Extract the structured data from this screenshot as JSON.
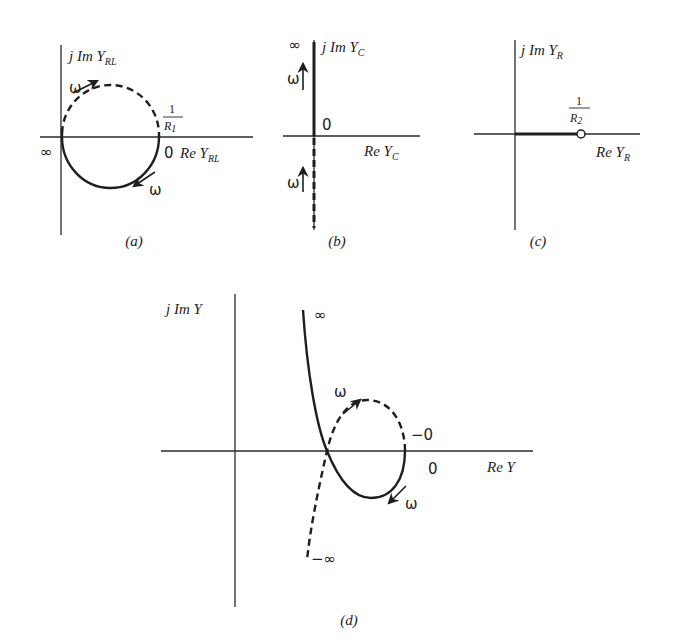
{
  "figure": {
    "panel_a": {
      "caption": "(a)",
      "y_axis_label": {
        "prefix": "j Im Y",
        "subscript": "RL"
      },
      "x_axis_label": {
        "prefix": "Re Y",
        "subscript": "RL"
      },
      "origin_label": "∞",
      "zero_label": "0",
      "intercept_label": {
        "numerator": "1",
        "denominator": "R",
        "subscript": "1"
      },
      "omega_upper": "ω",
      "omega_lower": "ω"
    },
    "panel_b": {
      "caption": "(b)",
      "y_axis_label": {
        "prefix": "j Im Y",
        "subscript": "C"
      },
      "x_axis_label": {
        "prefix": "Re Y",
        "subscript": "C"
      },
      "top_label": "∞",
      "zero_label": "0",
      "omega_upper": "ω",
      "omega_lower": "ω"
    },
    "panel_c": {
      "caption": "(c)",
      "y_axis_label": {
        "prefix": "j Im Y",
        "subscript": "R"
      },
      "x_axis_label": {
        "prefix": "Re Y",
        "subscript": "R"
      },
      "point_label": {
        "numerator": "1",
        "denominator": "R",
        "subscript": "2"
      }
    },
    "panel_d": {
      "caption": "(d)",
      "y_axis_label": "j Im Y",
      "x_axis_label": "Re Y",
      "top_label": "∞",
      "bottom_label": "−∞",
      "minus_zero_label": "−0",
      "zero_label": "0",
      "omega_upper": "ω",
      "omega_lower": "ω"
    }
  }
}
